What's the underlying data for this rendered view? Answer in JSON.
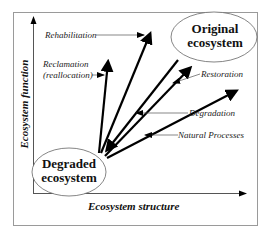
{
  "diagram": {
    "axes": {
      "x_label": "Ecosystem structure",
      "y_label": "Ecosystem function"
    },
    "nodes": {
      "original": {
        "line1": "Original",
        "line2": "ecosystem"
      },
      "degraded": {
        "line1": "Degraded",
        "line2": "ecosystem"
      }
    },
    "labels": {
      "rehabilitation": "Rehabilitation",
      "reclamation_1": "Reclamation",
      "reclamation_2": "(reallocation)",
      "restoration": "Restoration",
      "degradation": "Degradation",
      "natural_processes": "Natural Processes"
    },
    "colors": {
      "line": "#000000",
      "frame": "#9a9a9a",
      "leader": "#555555"
    }
  }
}
